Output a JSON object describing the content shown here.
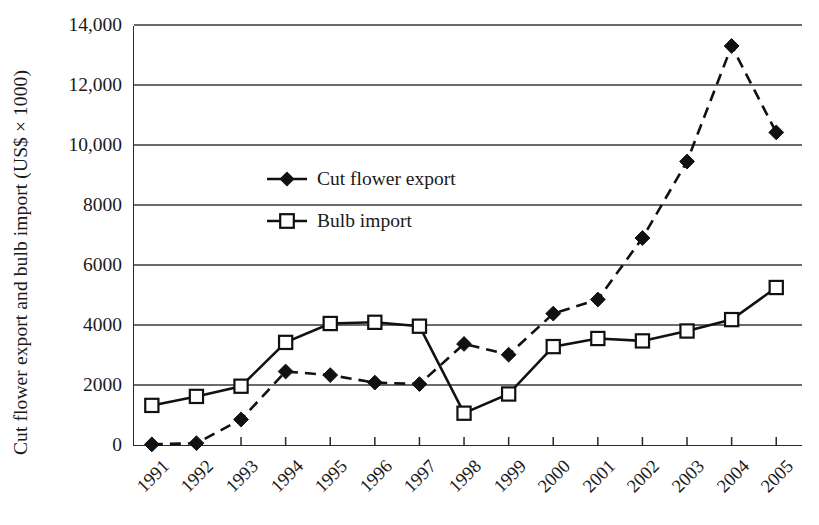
{
  "chart_data": {
    "type": "line",
    "title": "",
    "subtitle": "",
    "xlabel": "",
    "ylabel": "Cut flower export and bulb import (US$ × 1000)",
    "categories": [
      "1991",
      "1992",
      "1993",
      "1994",
      "1995",
      "1996",
      "1997",
      "1998",
      "1999",
      "2000",
      "2001",
      "2002",
      "2003",
      "2004",
      "2005"
    ],
    "x": [
      1991,
      1992,
      1993,
      1994,
      1995,
      1996,
      1997,
      1998,
      1999,
      2000,
      2001,
      2002,
      2003,
      2004,
      2005
    ],
    "series": [
      {
        "name": "Cut flower export",
        "marker": "filled-diamond",
        "line_style": "dashed",
        "color": "#111111",
        "values": [
          20,
          60,
          850,
          2450,
          2330,
          2080,
          2030,
          3370,
          3010,
          4380,
          4850,
          6900,
          9450,
          13300,
          10420
        ]
      },
      {
        "name": "Bulb import",
        "marker": "open-square",
        "line_style": "solid",
        "color": "#111111",
        "values": [
          1320,
          1620,
          1960,
          3420,
          4050,
          4090,
          3960,
          1060,
          1700,
          3280,
          3550,
          3470,
          3800,
          4180,
          5250
        ]
      }
    ],
    "ylim": [
      0,
      14000
    ],
    "yticks": [
      0,
      2000,
      4000,
      6000,
      8000,
      10000,
      12000,
      14000
    ],
    "ytick_labels": [
      "0",
      "2000",
      "4000",
      "6000",
      "8000",
      "10,000",
      "12,000",
      "14,000"
    ],
    "xlim": [
      1990.6,
      2005.6
    ],
    "grid": "horizontal",
    "legend_position": "upper-left-inside"
  },
  "legend": {
    "items": [
      {
        "label": "Cut flower export",
        "marker_icon": "filled-diamond-marker",
        "line_style": "solid"
      },
      {
        "label": "Bulb import",
        "marker_icon": "open-square-marker",
        "line_style": "solid"
      }
    ]
  }
}
